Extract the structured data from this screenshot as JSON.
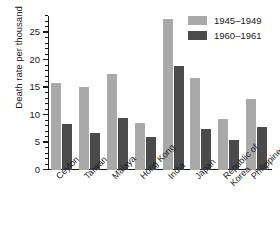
{
  "chart_data": {
    "type": "bar",
    "title": "",
    "xlabel": "",
    "ylabel": "Death rate per thousand",
    "ylim": [
      0,
      28
    ],
    "ytick_values": [
      0,
      5,
      10,
      15,
      20,
      25
    ],
    "ytick_labels": [
      "0",
      "5",
      "10",
      "15",
      "20",
      "25"
    ],
    "minor_tick_step": 1,
    "grid": false,
    "legend_position": "top-right",
    "categories": [
      "Ceylon",
      "Taiwan",
      "Malaya",
      "Hong Kong",
      "India",
      "Japan",
      "Republic of\nKorea",
      "Philippines"
    ],
    "series": [
      {
        "name": "1945–1949",
        "color": "#a9a9a9",
        "values": [
          15.8,
          15.1,
          17.5,
          8.5,
          27.5,
          16.7,
          9.3,
          13.0
        ]
      },
      {
        "name": "1960–1961",
        "color": "#4b4b4b",
        "values": [
          8.4,
          6.7,
          9.5,
          6.0,
          18.9,
          7.4,
          5.4,
          7.8
        ]
      }
    ]
  }
}
